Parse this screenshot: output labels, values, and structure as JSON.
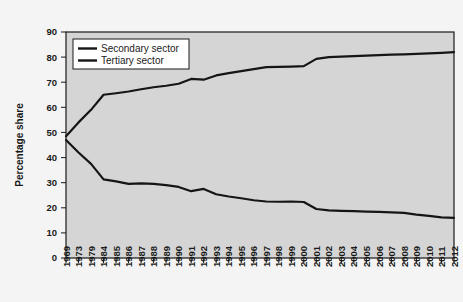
{
  "chart_data": {
    "type": "line",
    "title": "",
    "xlabel": "",
    "ylabel": "Percentage share",
    "ylim": [
      0,
      90
    ],
    "ytick_values": [
      0,
      10,
      20,
      30,
      40,
      50,
      60,
      70,
      80,
      90
    ],
    "ytick_labels": [
      "0",
      "10",
      "20",
      "30",
      "40",
      "50",
      "60",
      "70",
      "80",
      "90"
    ],
    "grid": false,
    "legend_position": "upper left",
    "categories": [
      "1969",
      "1973",
      "1979",
      "1984",
      "1985",
      "1986",
      "1987",
      "1988",
      "1989",
      "1990",
      "1991",
      "1992",
      "1993",
      "1994",
      "1995",
      "1996",
      "1997",
      "1998",
      "1999",
      "2000",
      "2001",
      "2002",
      "2003",
      "2004",
      "2005",
      "2006",
      "2007",
      "2008",
      "2009",
      "2010",
      "2011",
      "2012"
    ],
    "series": [
      {
        "name": "Secondary sector",
        "values": [
          47.0,
          42.0,
          37.5,
          31.3,
          30.5,
          29.5,
          29.7,
          29.5,
          29.0,
          28.3,
          26.6,
          27.5,
          25.4,
          24.5,
          23.8,
          23.0,
          22.5,
          22.4,
          22.5,
          22.3,
          19.5,
          19.0,
          18.8,
          18.7,
          18.5,
          18.4,
          18.2,
          18.0,
          17.3,
          16.8,
          16.2,
          16.0
        ]
      },
      {
        "name": "Tertiary sector",
        "values": [
          48.5,
          54.0,
          59.0,
          65.0,
          65.6,
          66.3,
          67.2,
          68.0,
          68.6,
          69.4,
          71.3,
          71.0,
          72.7,
          73.6,
          74.4,
          75.2,
          76.0,
          76.1,
          76.2,
          76.4,
          79.3,
          80.0,
          80.2,
          80.4,
          80.6,
          80.8,
          81.0,
          81.1,
          81.3,
          81.5,
          81.7,
          82.0
        ]
      }
    ]
  },
  "legend": {
    "entries": [
      {
        "label": "Secondary sector"
      },
      {
        "label": "Tertiary sector"
      }
    ]
  },
  "axes": {
    "y_title": "Percentage share"
  },
  "colors": {
    "plot_background": "#d5d5d5",
    "page_background": "#f4f4f4",
    "line": "#151515",
    "axis": "#1a1a1a"
  }
}
